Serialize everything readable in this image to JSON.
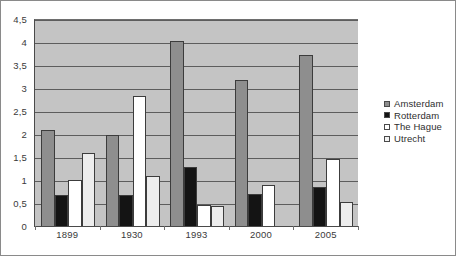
{
  "chart_data": {
    "type": "bar",
    "title": "",
    "subtitle": "",
    "xlabel": "",
    "ylabel": "",
    "categories": [
      "1899",
      "1930",
      "1993",
      "2000",
      "2005"
    ],
    "series": [
      {
        "name": "Amsterdam",
        "color": "#8e8e8e",
        "values": [
          2.1,
          2.0,
          4.05,
          3.2,
          3.75
        ]
      },
      {
        "name": "Rotterdam",
        "color": "#141414",
        "values": [
          0.7,
          0.69,
          1.3,
          0.72,
          0.87
        ]
      },
      {
        "name": "The Hague",
        "color": "#ffffff",
        "values": [
          1.03,
          2.85,
          0.47,
          0.92,
          1.47
        ]
      },
      {
        "name": "Utrecht",
        "color": "#ededed",
        "values": [
          1.6,
          1.1,
          0.45,
          null,
          0.55
        ]
      }
    ],
    "ylim": [
      0,
      4.5
    ],
    "ytick_step": 0.5,
    "yticks": [
      4.5,
      4,
      3.5,
      3,
      2.5,
      2,
      1.5,
      1,
      0.5,
      0
    ],
    "ytick_labels": [
      "4,5",
      "4",
      "3,5",
      "3",
      "2,5",
      "2",
      "1,5",
      "1",
      "0,5",
      "0"
    ],
    "grid": true,
    "grid_axis": "y",
    "legend_position": "right",
    "decimal_separator": ",",
    "plot_background": "#c4c4c4",
    "figure_background": "#ffffff"
  },
  "legend": {
    "items": [
      {
        "label": "Amsterdam"
      },
      {
        "label": "Rotterdam"
      },
      {
        "label": "The Hague"
      },
      {
        "label": "Utrecht"
      }
    ]
  }
}
